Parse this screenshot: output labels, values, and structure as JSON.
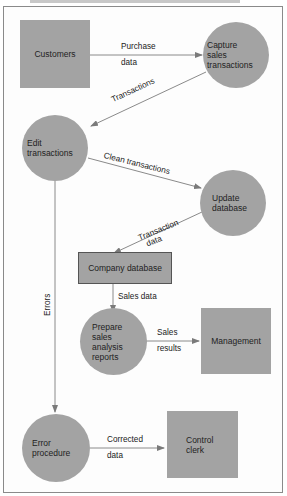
{
  "diagram": {
    "type": "data-flow-diagram",
    "colors": {
      "node_fill": "#a3a3a3",
      "edge": "#7a7a7a",
      "store_border": "#555555",
      "frame": "#8a8a8a"
    },
    "nodes": {
      "customers": {
        "label": "Customers",
        "shape": "square"
      },
      "capture": {
        "label": "Capture\nsales\ntransactions",
        "lines": [
          "Capture",
          "sales",
          "transactions"
        ],
        "shape": "circle"
      },
      "edit": {
        "lines": [
          "Edit",
          "transactions"
        ],
        "shape": "circle"
      },
      "update": {
        "lines": [
          "Update",
          "database"
        ],
        "shape": "circle"
      },
      "company_db": {
        "label": "Company database",
        "shape": "data-store"
      },
      "prepare": {
        "lines": [
          "Prepare",
          "sales",
          "analysis",
          "reports"
        ],
        "shape": "circle"
      },
      "management": {
        "label": "Management",
        "shape": "square"
      },
      "error_proc": {
        "lines": [
          "Error",
          "procedure"
        ],
        "shape": "circle"
      },
      "control_clerk": {
        "lines": [
          "Control",
          "clerk"
        ],
        "shape": "square"
      }
    },
    "edges": {
      "purchase_data": {
        "from": "customers",
        "to": "capture",
        "lines": [
          "Purchase",
          "data"
        ]
      },
      "transactions": {
        "from": "capture",
        "to": "edit",
        "label": "Transactions"
      },
      "clean_transactions": {
        "from": "edit",
        "to": "update",
        "label": "Clean transactions"
      },
      "transaction_data": {
        "from": "update",
        "to": "company_db",
        "lines": [
          "Transaction",
          "data"
        ]
      },
      "sales_data": {
        "from": "company_db",
        "to": "prepare",
        "label": "Sales data"
      },
      "sales_results": {
        "from": "prepare",
        "to": "management",
        "lines": [
          "Sales",
          "results"
        ]
      },
      "errors": {
        "from": "edit",
        "to": "error_proc",
        "label": "Errors"
      },
      "corrected_data": {
        "from": "error_proc",
        "to": "control_clerk",
        "lines": [
          "Corrected",
          "data"
        ]
      }
    }
  }
}
